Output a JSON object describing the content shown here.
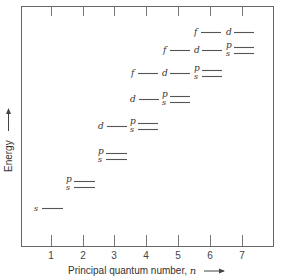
{
  "diagram": {
    "title": "",
    "x_axis": {
      "label": "Principal quantum number, ",
      "label_var": "n",
      "ticks": [
        "1",
        "2",
        "3",
        "4",
        "5",
        "6",
        "7"
      ]
    },
    "y_axis": {
      "label": "Energy"
    },
    "rows": [
      {
        "n_row": 1,
        "levels": [
          {
            "label": "s",
            "n": 1
          }
        ]
      },
      {
        "n_row": 2,
        "levels": [
          {
            "label": "p",
            "n": 2
          },
          {
            "label": "s",
            "n": 2
          }
        ]
      },
      {
        "n_row": 3,
        "levels": [
          {
            "label": "p",
            "n": 3
          },
          {
            "label": "s",
            "n": 3
          }
        ]
      },
      {
        "n_row": 4,
        "levels": [
          {
            "label": "d",
            "n": 3
          },
          {
            "label": "p",
            "n": 4
          },
          {
            "label": "s",
            "n": 4
          }
        ]
      },
      {
        "n_row": 5,
        "levels": [
          {
            "label": "d",
            "n": 4
          },
          {
            "label": "p",
            "n": 5
          },
          {
            "label": "s",
            "n": 5
          }
        ]
      },
      {
        "n_row": 6,
        "levels": [
          {
            "label": "f",
            "n": 4
          },
          {
            "label": "d",
            "n": 5
          },
          {
            "label": "p",
            "n": 6
          },
          {
            "label": "s",
            "n": 6
          }
        ]
      },
      {
        "n_row": 7,
        "levels": [
          {
            "label": "f",
            "n": 5
          },
          {
            "label": "d",
            "n": 6
          },
          {
            "label": "p",
            "n": 7
          },
          {
            "label": "s",
            "n": 7
          }
        ]
      },
      {
        "n_row": 8,
        "levels": [
          {
            "label": "f",
            "n": 6
          },
          {
            "label": "d",
            "n": 7
          }
        ]
      }
    ],
    "labels": {
      "s": "s",
      "p": "p",
      "d": "d",
      "f": "f"
    }
  }
}
